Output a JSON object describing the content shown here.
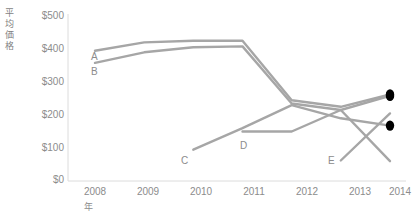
{
  "chart_data": {
    "type": "line",
    "title": "",
    "subtitle": "",
    "xlabel": "年",
    "ylabel": "平均価格",
    "x": [
      2008,
      2009,
      2010,
      2011,
      2012,
      2013,
      2014
    ],
    "categories": [
      "2008",
      "2009",
      "2010",
      "2011",
      "2012",
      "2013",
      "2014"
    ],
    "ytick_labels": [
      "$500",
      "$400",
      "$300",
      "$200",
      "$100",
      "$0"
    ],
    "ytick_values": [
      500,
      400,
      300,
      200,
      100,
      0
    ],
    "ylim": [
      0,
      500
    ],
    "xlim": [
      2008,
      2014
    ],
    "grid": false,
    "legend_position": "inline-labels",
    "line_color": "#a6a6a6",
    "endpoint_marker_color": "#000000",
    "axis_color": "#d9d9d9",
    "series": [
      {
        "name": "A",
        "label": "A",
        "values": [
          395,
          420,
          425,
          425,
          245,
          225,
          262
        ],
        "endpoint_marker": true
      },
      {
        "name": "B",
        "label": "B",
        "values": [
          358,
          390,
          405,
          408,
          235,
          215,
          258
        ],
        "endpoint_marker": true
      },
      {
        "name": "C",
        "label": "C",
        "values": [
          null,
          null,
          95,
          160,
          230,
          190,
          168
        ],
        "endpoint_marker": true
      },
      {
        "name": "D",
        "label": "D",
        "values": [
          null,
          null,
          null,
          150,
          150,
          215,
          60
        ],
        "endpoint_marker": false
      },
      {
        "name": "E",
        "label": "E",
        "values": [
          null,
          null,
          null,
          null,
          null,
          62,
          205
        ],
        "endpoint_marker": false
      }
    ],
    "series_labels": [
      {
        "text": "A",
        "x": 91,
        "y": 51
      },
      {
        "text": "B",
        "x": 91,
        "y": 66
      },
      {
        "text": "C",
        "x": 181,
        "y": 155
      },
      {
        "text": "D",
        "x": 240,
        "y": 140
      },
      {
        "text": "E",
        "x": 328,
        "y": 155
      }
    ]
  }
}
